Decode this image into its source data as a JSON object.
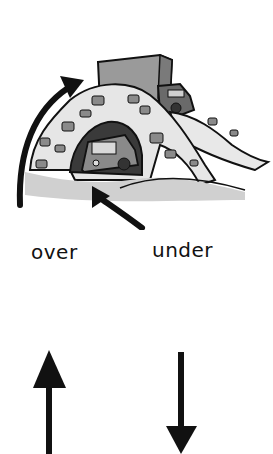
{
  "illustration": {
    "subject": "stone arch bridge with truck driving over and car driving under",
    "icons": [
      "curved-arrow-over-icon",
      "curved-arrow-under-icon"
    ]
  },
  "labels": {
    "over": "over",
    "under": "under"
  },
  "arrows": {
    "left": "up-arrow-icon",
    "right": "down-arrow-icon"
  },
  "colors": {
    "ink": "#111111",
    "stone": "#e6e6e6",
    "block": "#8a8a8a",
    "shadow": "#3a3a3a"
  }
}
